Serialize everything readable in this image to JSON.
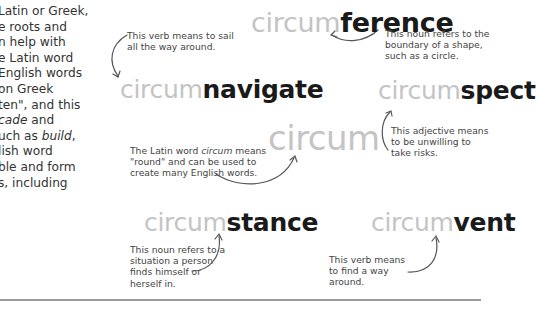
{
  "intro": {
    "lines": [
      {
        "pre": "Latin or Greek,",
        "it": "",
        "post": ""
      },
      {
        "pre": "e roots and",
        "it": "",
        "post": ""
      },
      {
        "pre": "n help with",
        "it": "",
        "post": ""
      },
      {
        "pre": "e Latin word",
        "it": "",
        "post": ""
      },
      {
        "pre": "English words",
        "it": "",
        "post": ""
      },
      {
        "pre": "on Greek",
        "it": "",
        "post": ""
      },
      {
        "pre": "ten\", and this",
        "it": "",
        "post": ""
      },
      {
        "pre": "",
        "it": "cade",
        "post": " and"
      },
      {
        "pre": "uch as ",
        "it": "build",
        "post": ","
      },
      {
        "pre": "lish word",
        "it": "",
        "post": ""
      },
      {
        "pre": "ble and form",
        "it": "",
        "post": ""
      },
      {
        "pre": "s, including",
        "it": "",
        "post": ""
      }
    ]
  },
  "center": {
    "word": "circum",
    "note_pre": "The Latin word ",
    "note_it": "circum",
    "note_post": " means \"round\" and can be used to create many English words."
  },
  "words": {
    "circumference": {
      "prefix": "circum",
      "root": "ference",
      "note": "This noun refers to the boundary of a shape, such as a circle."
    },
    "circumnavigate": {
      "prefix": "circum",
      "root": "navigate",
      "note": "This verb means to sail all the way around."
    },
    "circumspect": {
      "prefix": "circum",
      "root": "spect",
      "note": "This adjective means to be unwilling to take risks."
    },
    "circumstance": {
      "prefix": "circum",
      "root": "stance",
      "note": "This noun refers to a situation a person finds himself or herself in."
    },
    "circumvent": {
      "prefix": "circum",
      "root": "vent",
      "note": "This verb means to find a way around."
    }
  },
  "colors": {
    "prefix": "#c4c4c4",
    "root": "#1a1a1a",
    "body_text": "#333333",
    "note_text": "#444444",
    "rule": "#9a9a9a"
  }
}
